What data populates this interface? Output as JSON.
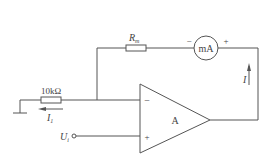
{
  "diagram": {
    "type": "op-amp circuit (voltage-to-current converter)",
    "components": {
      "feedback_resistor": {
        "label_main": "R",
        "label_sub": "m"
      },
      "ammeter": {
        "label": "mA",
        "minus_sign": "−",
        "plus_sign": "+"
      },
      "input_resistor": {
        "label": "10kΩ"
      },
      "op_amp": {
        "label": "A",
        "inverting_sign": "−",
        "noninverting_sign": "+"
      },
      "input_terminal": {
        "label_main": "U",
        "label_sub": "i"
      }
    },
    "currents": {
      "output_current": {
        "label": "I",
        "direction": "up"
      },
      "input_current": {
        "label_main": "I",
        "label_sub": "1",
        "direction": "left"
      }
    },
    "colors": {
      "line": "#555555",
      "text": "#444444",
      "background": "#ffffff"
    }
  }
}
